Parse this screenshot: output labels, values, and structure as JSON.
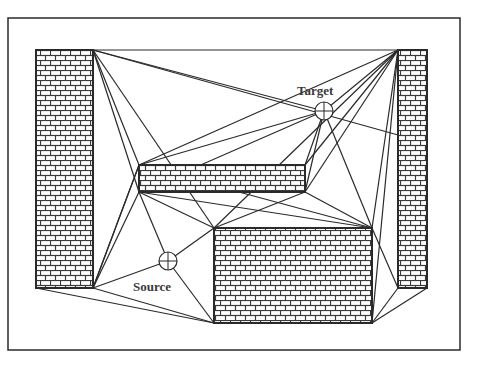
{
  "diagram": {
    "labels": {
      "target": "Target",
      "source": "Source"
    },
    "colors": {
      "line": "#2a2a2a",
      "brick_fill": "#ffffff",
      "mortar": "#3a3a3a",
      "background": "#ffffff"
    },
    "frame": {
      "x": 8,
      "y": 18,
      "w": 452,
      "h": 332
    },
    "obstacles": [
      {
        "name": "left-wall",
        "x": 36,
        "y": 50,
        "w": 57,
        "h": 238
      },
      {
        "name": "right-wall",
        "x": 398,
        "y": 50,
        "w": 29,
        "h": 238
      },
      {
        "name": "middle-block",
        "x": 139,
        "y": 165,
        "w": 166,
        "h": 27
      },
      {
        "name": "bottom-block",
        "x": 214,
        "y": 228,
        "w": 158,
        "h": 95
      }
    ],
    "points": {
      "target": {
        "x": 324,
        "y": 111,
        "r": 9
      },
      "source": {
        "x": 168,
        "y": 261,
        "r": 9
      }
    },
    "edges": [
      [
        93,
        50,
        398,
        50
      ],
      [
        93,
        50,
        324,
        111
      ],
      [
        93,
        50,
        398,
        135
      ],
      [
        93,
        50,
        139,
        165
      ],
      [
        93,
        50,
        139,
        192
      ],
      [
        93,
        50,
        214,
        228
      ],
      [
        139,
        165,
        324,
        111
      ],
      [
        139,
        165,
        398,
        50
      ],
      [
        139,
        192,
        324,
        111
      ],
      [
        139,
        192,
        305,
        165
      ],
      [
        139,
        192,
        214,
        228
      ],
      [
        139,
        192,
        372,
        228
      ],
      [
        139,
        192,
        168,
        261
      ],
      [
        139,
        165,
        93,
        288
      ],
      [
        139,
        192,
        93,
        288
      ],
      [
        305,
        165,
        324,
        111
      ],
      [
        305,
        192,
        324,
        111
      ],
      [
        305,
        165,
        398,
        50
      ],
      [
        305,
        192,
        398,
        50
      ],
      [
        305,
        192,
        214,
        228
      ],
      [
        305,
        192,
        372,
        228
      ],
      [
        324,
        111,
        372,
        228
      ],
      [
        324,
        111,
        398,
        50
      ],
      [
        214,
        228,
        398,
        50
      ],
      [
        372,
        228,
        398,
        50
      ],
      [
        372,
        228,
        398,
        288
      ],
      [
        372,
        228,
        214,
        228
      ],
      [
        372,
        323,
        398,
        50
      ],
      [
        372,
        323,
        398,
        288
      ],
      [
        372,
        323,
        427,
        288
      ],
      [
        372,
        228,
        139,
        165
      ],
      [
        168,
        261,
        93,
        288
      ],
      [
        168,
        261,
        214,
        228
      ],
      [
        168,
        261,
        214,
        323
      ],
      [
        93,
        288,
        214,
        323
      ],
      [
        36,
        288,
        214,
        323
      ],
      [
        93,
        288,
        139,
        165
      ]
    ]
  }
}
